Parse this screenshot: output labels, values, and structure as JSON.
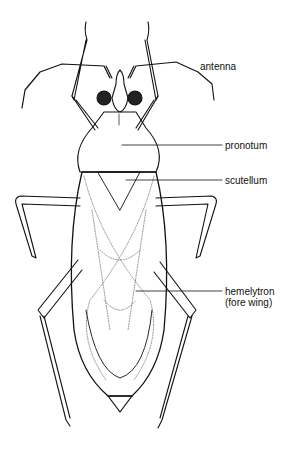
{
  "diagram": {
    "labels": [
      {
        "id": "antenna",
        "text": "antenna"
      },
      {
        "id": "pronotum",
        "text": "pronotum"
      },
      {
        "id": "scutellum",
        "text": "scutellum"
      },
      {
        "id": "hemelytron",
        "text": "hemelytron",
        "sub": "(fore wing)"
      }
    ]
  }
}
